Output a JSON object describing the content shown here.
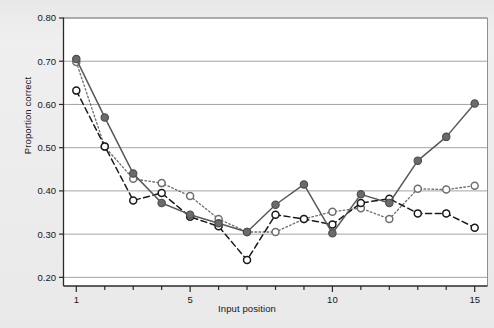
{
  "chart_data": {
    "type": "line",
    "title": "",
    "subtitle": "",
    "xlabel": "Input position",
    "ylabel": "Proportion correct",
    "x": [
      1,
      2,
      3,
      4,
      5,
      6,
      7,
      8,
      9,
      10,
      11,
      12,
      13,
      14,
      15
    ],
    "xlim": [
      0.55,
      15.45
    ],
    "ylim": [
      0.18,
      0.8
    ],
    "xticks": [
      1,
      2,
      3,
      4,
      5,
      6,
      7,
      8,
      9,
      10,
      11,
      12,
      13,
      14,
      15
    ],
    "xticklabels": [
      "1",
      "",
      "",
      "",
      "5",
      "",
      "",
      "",
      "",
      "10",
      "",
      "",
      "",
      "",
      "15"
    ],
    "yticks": [
      0.2,
      0.3,
      0.4,
      0.5,
      0.6,
      0.7,
      0.8
    ],
    "yticklabels": [
      "0.20",
      "0.30",
      "0.40",
      "0.50",
      "0.60",
      "0.70",
      "0.80"
    ],
    "grid": "horizontal",
    "legend": "none",
    "series": [
      {
        "name": "solid-filled",
        "marker": "filled-circle",
        "linestyle": "solid",
        "color": "#595959",
        "values": [
          0.705,
          0.57,
          0.44,
          0.372,
          0.345,
          0.325,
          0.305,
          0.368,
          0.415,
          0.302,
          0.392,
          0.372,
          0.47,
          0.525,
          0.602
        ]
      },
      {
        "name": "dashed-open",
        "marker": "open-circle",
        "linestyle": "dashed",
        "color": "#1a1a1a",
        "values": [
          0.632,
          0.503,
          0.378,
          0.395,
          0.34,
          0.318,
          0.24,
          0.345,
          0.335,
          0.322,
          0.372,
          0.382,
          0.348,
          0.348,
          0.315
        ]
      },
      {
        "name": "dotted-open",
        "marker": "open-circle",
        "linestyle": "dotted",
        "color": "#6f6f6f",
        "values": [
          0.698,
          0.502,
          0.428,
          0.418,
          0.388,
          0.335,
          0.305,
          0.305,
          0.335,
          0.352,
          0.36,
          0.335,
          0.405,
          0.403,
          0.412
        ]
      }
    ]
  },
  "axes": {
    "ylabel": "Proportion correct",
    "xlabel": "Input position"
  },
  "colors": {
    "background": "#ececed",
    "plot_background": "#ffffff",
    "gridline": "#9a9a9a",
    "axis": "#2a2a2a",
    "series_solid": "#595959",
    "series_dashed": "#1a1a1a",
    "series_dotted": "#6f6f6f"
  }
}
